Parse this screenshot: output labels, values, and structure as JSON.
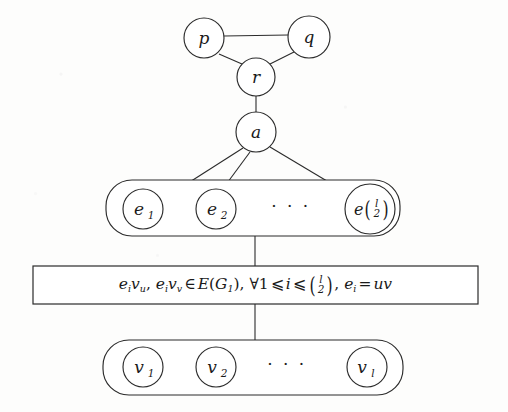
{
  "figure": {
    "type": "graph-construction-diagram",
    "background_color": "#fdfdfc",
    "stroke_color": "#2b2b2b"
  },
  "nodes": {
    "p": {
      "label": "p",
      "cx": 204,
      "cy": 38,
      "r": 20
    },
    "q": {
      "label": "q",
      "cx": 309,
      "cy": 37,
      "r": 21
    },
    "r": {
      "label": "r",
      "cx": 256,
      "cy": 77,
      "r": 19
    },
    "a": {
      "label": "a",
      "cx": 256,
      "cy": 132,
      "r": 20
    }
  },
  "edges": [
    {
      "from": "p",
      "to": "q"
    },
    {
      "from": "p",
      "to": "r"
    },
    {
      "from": "q",
      "to": "r"
    },
    {
      "from": "r",
      "to": "a"
    },
    {
      "from": "a",
      "to": "e1"
    },
    {
      "from": "a",
      "to": "e2"
    },
    {
      "from": "a",
      "to": "en"
    }
  ],
  "e_group": {
    "name": "edge-vertex-group",
    "x": 106,
    "y": 180,
    "width": 294,
    "height": 56,
    "radius": 26,
    "items": [
      {
        "label": "e",
        "sub": "1",
        "cx": 143,
        "cy": 209,
        "r": 20
      },
      {
        "label": "e",
        "sub": "2",
        "cx": 216,
        "cy": 209,
        "r": 20
      },
      {
        "label": "e",
        "sub": "binom",
        "binom_top": "l",
        "binom_bottom": "2",
        "cx": 370,
        "cy": 209,
        "r": 25
      }
    ],
    "ellipsis": "· · ·",
    "ellipsis_x": 291,
    "ellipsis_y": 212
  },
  "formula_box": {
    "name": "edge-condition-box",
    "x": 33,
    "y": 266,
    "width": 445,
    "height": 38,
    "text_plain": "e_i v_u, e_i v_v ∈ E(G_1), ∀1 ⩽ i ⩽ (l 2), e_i = uv",
    "parts": {
      "term1_e": "e",
      "term1_sub": "i",
      "term1_v": "v",
      "term1_vsub": "u",
      "comma1": ", ",
      "term2_e": "e",
      "term2_sub": "i",
      "term2_v": "v",
      "term2_vsub": "v",
      "member": "∈",
      "edgeset_E": "E",
      "edgeset_open": "(",
      "edgeset_G": "G",
      "edgeset_Gsub": "1",
      "edgeset_close": ")",
      "comma2": ", ",
      "forall": "∀",
      "one": "1",
      "leq1": "⩽",
      "index_i": "i",
      "leq2": "⩽",
      "binom_top": "l",
      "binom_bottom": "2",
      "comma3": ", ",
      "term3_e": "e",
      "term3_sub": "i",
      "equals": "=",
      "rhs": "uv"
    }
  },
  "v_group": {
    "name": "vertex-group",
    "x": 103,
    "y": 340,
    "width": 300,
    "height": 55,
    "radius": 26,
    "items": [
      {
        "label": "v",
        "sub": "1",
        "cx": 143,
        "cy": 367,
        "r": 20
      },
      {
        "label": "v",
        "sub": "2",
        "cx": 216,
        "cy": 367,
        "r": 20
      },
      {
        "label": "v",
        "sub": "l",
        "cx": 367,
        "cy": 367,
        "r": 20
      }
    ],
    "ellipsis": "· · ·",
    "ellipsis_x": 287,
    "ellipsis_y": 370
  },
  "connectors": [
    {
      "name": "e-group-to-box",
      "x": 255,
      "y1": 236,
      "y2": 266
    },
    {
      "name": "box-to-v-group",
      "x": 255,
      "y1": 304,
      "y2": 340
    }
  ]
}
